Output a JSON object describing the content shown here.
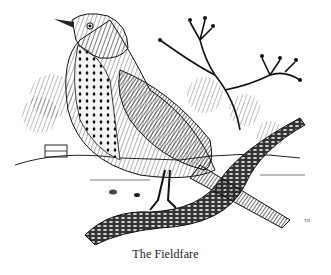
{
  "figure": {
    "caption": "The Fieldfare",
    "signature": "TB",
    "colors": {
      "ink": "#111111",
      "paper": "#ffffff"
    }
  }
}
